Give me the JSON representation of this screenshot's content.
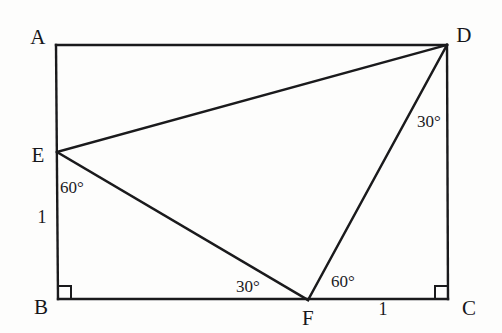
{
  "figure": {
    "background_color": "#fdfdfc",
    "stroke_color": "#1a1a1c",
    "canvas": {
      "width": 502,
      "height": 333
    }
  },
  "vertices": [
    {
      "name": "A",
      "label": "A",
      "x": 56,
      "y": 45,
      "label_x": 38,
      "label_y": 37
    },
    {
      "name": "D",
      "label": "D",
      "x": 447,
      "y": 45,
      "label_x": 464,
      "label_y": 35
    },
    {
      "name": "E",
      "label": "E",
      "x": 57,
      "y": 152,
      "label_x": 38,
      "label_y": 155
    },
    {
      "name": "B",
      "label": "B",
      "x": 58,
      "y": 299,
      "label_x": 41,
      "label_y": 307
    },
    {
      "name": "F",
      "label": "F",
      "x": 308,
      "y": 300,
      "label_x": 308,
      "label_y": 318
    },
    {
      "name": "C",
      "label": "C",
      "x": 448,
      "y": 299,
      "label_x": 469,
      "label_y": 308
    }
  ],
  "segments": [
    {
      "name": "side-AB",
      "from": "A",
      "to": "B"
    },
    {
      "name": "side-AD",
      "from": "A",
      "to": "D"
    },
    {
      "name": "side-DC",
      "from": "D",
      "to": "C"
    },
    {
      "name": "side-BC",
      "from": "B",
      "to": "C"
    },
    {
      "name": "segment-ED",
      "from": "E",
      "to": "D"
    },
    {
      "name": "segment-EF",
      "from": "E",
      "to": "F"
    },
    {
      "name": "segment-FD",
      "from": "F",
      "to": "D"
    }
  ],
  "angle_labels": [
    {
      "name": "angle-at-E-BEF",
      "text": "60°",
      "x": 72,
      "y": 187
    },
    {
      "name": "angle-at-F-EFB",
      "text": "30°",
      "x": 248,
      "y": 286
    },
    {
      "name": "angle-at-F-DFC",
      "text": "60°",
      "x": 343,
      "y": 281
    },
    {
      "name": "angle-at-D-FDC",
      "text": "30°",
      "x": 429,
      "y": 121
    }
  ],
  "length_labels": [
    {
      "name": "length-EB",
      "text": "1",
      "x": 42,
      "y": 217
    },
    {
      "name": "length-FC",
      "text": "1",
      "x": 383,
      "y": 309
    }
  ],
  "right_angle_marks": [
    {
      "name": "right-angle-at-B",
      "x": 58,
      "y": 299,
      "dir_x": 1,
      "dir_y": -1,
      "size": 13
    },
    {
      "name": "right-angle-at-C",
      "x": 448,
      "y": 299,
      "dir_x": -1,
      "dir_y": -1,
      "size": 13
    }
  ]
}
